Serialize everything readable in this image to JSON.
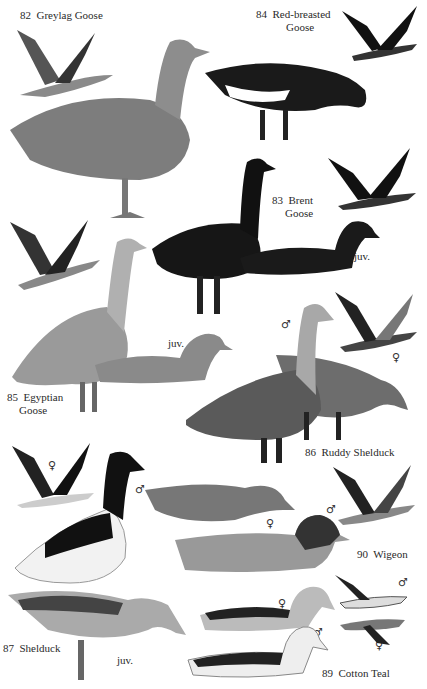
{
  "plate": {
    "species": [
      {
        "number": "82",
        "name": "Greylag Goose"
      },
      {
        "number": "84",
        "name": "Red-breasted",
        "name_line2": "Goose"
      },
      {
        "number": "83",
        "name": "Brent",
        "name_line2": "Goose"
      },
      {
        "number": "85",
        "name": "Egyptian",
        "name_line2": "Goose"
      },
      {
        "number": "86",
        "name": "Ruddy Shelduck"
      },
      {
        "number": "87",
        "name": "Shelduck"
      },
      {
        "number": "90",
        "name": "Wigeon"
      },
      {
        "number": "89",
        "name": "Cotton Teal"
      }
    ],
    "annotations": {
      "juv": "juv.",
      "male": "♂",
      "female": "♀"
    }
  }
}
